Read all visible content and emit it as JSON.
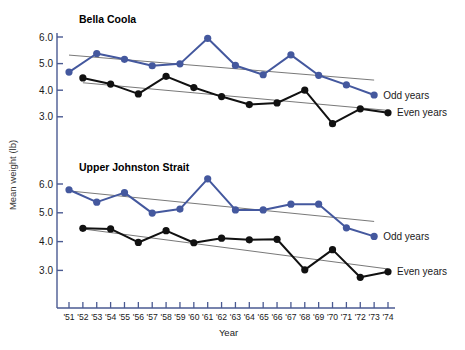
{
  "figure": {
    "ylabel": "Mean weight (lb)",
    "xlabel": "Year",
    "colors": {
      "odd": "#44589e",
      "even": "#111111",
      "axis": "#4a5a92",
      "trend": "#555555"
    }
  },
  "chart_data": {
    "type": "line",
    "title": "",
    "xlabel": "Year",
    "ylabel": "Mean weight (lb)",
    "x": [
      "'51",
      "'52",
      "'53",
      "'54",
      "'55",
      "'56",
      "'57",
      "'58",
      "'59",
      "'60",
      "'61",
      "'62",
      "'63",
      "'64",
      "'65",
      "'66",
      "'67",
      "'68",
      "'69",
      "'70",
      "'71",
      "'72",
      "'73",
      "'74"
    ],
    "yticks": [
      3.0,
      4.0,
      5.0,
      6.0
    ],
    "ytick_labels": [
      "3.0",
      "4.0",
      "5.0",
      "6.0"
    ],
    "ylim": [
      2.45,
      6.2
    ],
    "grid": false,
    "legend_position": "right",
    "panels": [
      {
        "name": "bella-coola",
        "title": "Bella Coola",
        "series": [
          {
            "name": "Odd years",
            "color": "#44589e",
            "points": [
              {
                "x": "'51",
                "y": 4.68
              },
              {
                "x": "'53",
                "y": 5.38
              },
              {
                "x": "'55",
                "y": 5.16
              },
              {
                "x": "'57",
                "y": 4.92
              },
              {
                "x": "'59",
                "y": 4.99
              },
              {
                "x": "'61",
                "y": 5.95
              },
              {
                "x": "'63",
                "y": 4.93
              },
              {
                "x": "'65",
                "y": 4.58
              },
              {
                "x": "'67",
                "y": 5.33
              },
              {
                "x": "'69",
                "y": 4.56
              },
              {
                "x": "'71",
                "y": 4.2
              },
              {
                "x": "'73",
                "y": 3.82
              }
            ],
            "trend": {
              "x0": "'51",
              "y0": 5.32,
              "x1": "'73",
              "y1": 4.38
            }
          },
          {
            "name": "Even years",
            "color": "#111111",
            "points": [
              {
                "x": "'52",
                "y": 4.46
              },
              {
                "x": "'54",
                "y": 4.23
              },
              {
                "x": "'56",
                "y": 3.86
              },
              {
                "x": "'58",
                "y": 4.52
              },
              {
                "x": "'60",
                "y": 4.1
              },
              {
                "x": "'62",
                "y": 3.76
              },
              {
                "x": "'64",
                "y": 3.46
              },
              {
                "x": "'66",
                "y": 3.52
              },
              {
                "x": "'68",
                "y": 4.0
              },
              {
                "x": "'70",
                "y": 2.74
              },
              {
                "x": "'72",
                "y": 3.3
              },
              {
                "x": "'74",
                "y": 3.15
              }
            ],
            "trend": {
              "x0": "'52",
              "y0": 4.28,
              "x1": "'74",
              "y1": 3.24
            }
          }
        ]
      },
      {
        "name": "upper-johnston-strait",
        "title": "Upper Johnston Strait",
        "series": [
          {
            "name": "Odd years",
            "color": "#44589e",
            "points": [
              {
                "x": "'51",
                "y": 5.8
              },
              {
                "x": "'53",
                "y": 5.37
              },
              {
                "x": "'55",
                "y": 5.7
              },
              {
                "x": "'57",
                "y": 4.99
              },
              {
                "x": "'59",
                "y": 5.13
              },
              {
                "x": "'61",
                "y": 6.18
              },
              {
                "x": "'63",
                "y": 5.1
              },
              {
                "x": "'65",
                "y": 5.1
              },
              {
                "x": "'67",
                "y": 5.3
              },
              {
                "x": "'69",
                "y": 5.3
              },
              {
                "x": "'71",
                "y": 4.48
              },
              {
                "x": "'73",
                "y": 4.18
              }
            ],
            "trend": {
              "x0": "'51",
              "y0": 5.76,
              "x1": "'73",
              "y1": 4.7
            }
          },
          {
            "name": "Even years",
            "color": "#111111",
            "points": [
              {
                "x": "'52",
                "y": 4.46
              },
              {
                "x": "'54",
                "y": 4.44
              },
              {
                "x": "'56",
                "y": 3.97
              },
              {
                "x": "'58",
                "y": 4.38
              },
              {
                "x": "'60",
                "y": 3.96
              },
              {
                "x": "'62",
                "y": 4.12
              },
              {
                "x": "'64",
                "y": 4.06
              },
              {
                "x": "'66",
                "y": 4.08
              },
              {
                "x": "'68",
                "y": 3.02
              },
              {
                "x": "'70",
                "y": 3.72
              },
              {
                "x": "'72",
                "y": 2.76
              },
              {
                "x": "'74",
                "y": 2.95
              }
            ],
            "trend": {
              "x0": "'52",
              "y0": 4.44,
              "x1": "'74",
              "y1": 3.05
            }
          }
        ]
      }
    ],
    "legend": [
      {
        "label": "Odd years",
        "color": "#44589e"
      },
      {
        "label": "Even years",
        "color": "#111111"
      }
    ]
  }
}
